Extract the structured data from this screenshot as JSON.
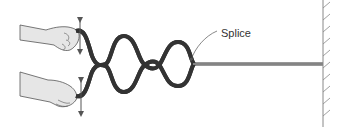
{
  "figure": {
    "labels": {
      "splice": "Splice"
    },
    "elements": {
      "upper_hand": "hand holding upper rope end",
      "lower_hand": "hand holding lower rope end",
      "upper_arrow": "double-headed vertical arrow",
      "lower_arrow": "double-headed vertical arrow",
      "rope_loops": "two ropes forming standing-wave loops",
      "spliced_rope": "single rope to wall",
      "wall": "fixed wall with hatching"
    },
    "colors": {
      "line": "#333333",
      "hand_fill": "#e6e6e6",
      "rope_inner": "#ffffff",
      "wall": "#888888"
    }
  }
}
